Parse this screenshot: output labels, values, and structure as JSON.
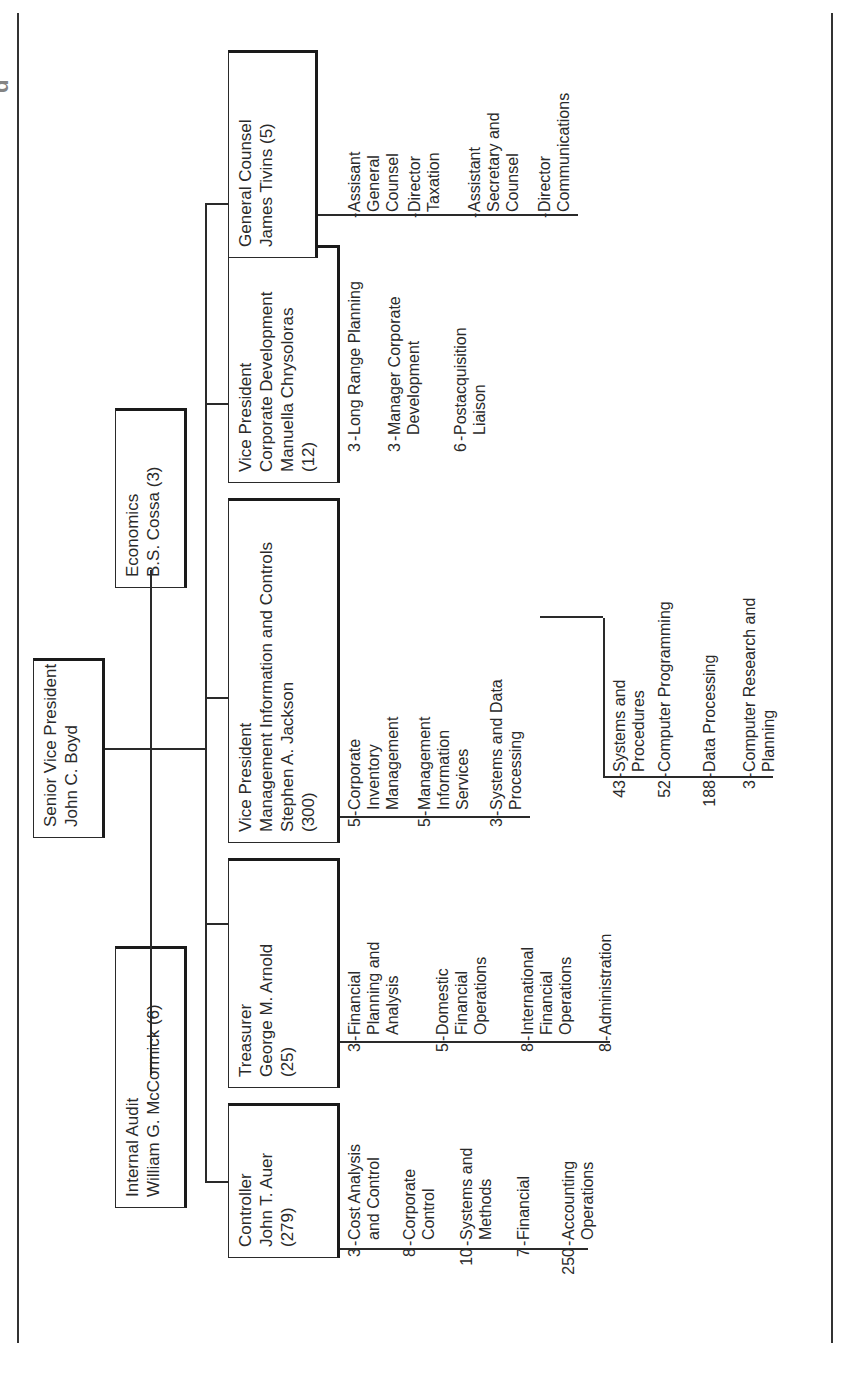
{
  "caption": "Figure … corporate financial organization (partially cut off)",
  "top": {
    "title": "Senior Vice President",
    "name": "John C. Boyd"
  },
  "staff": [
    {
      "id": "internal-audit",
      "title": "Internal Audit",
      "name": "William G. McCormick (6)"
    },
    {
      "id": "economics",
      "title": "Economics",
      "name": "B.S. Cossa (3)"
    }
  ],
  "departments": [
    {
      "id": "controller",
      "lines": [
        "Controller",
        "John T. Auer",
        "(279)"
      ],
      "units": [
        {
          "count": "3",
          "label": [
            "Cost Analysis",
            "and Control"
          ]
        },
        {
          "count": "8",
          "label": [
            "Corporate",
            "Control"
          ]
        },
        {
          "count": "10",
          "label": [
            "Systems and",
            "Methods"
          ]
        },
        {
          "count": "7",
          "label": [
            "Financial"
          ]
        },
        {
          "count": "250",
          "label": [
            "Accounting",
            "Operations"
          ]
        }
      ]
    },
    {
      "id": "treasurer",
      "lines": [
        "Treasurer",
        "George M. Arnold",
        "(25)"
      ],
      "units": [
        {
          "count": "3",
          "label": [
            "Financial",
            "Planning and",
            "Analysis"
          ]
        },
        {
          "count": "5",
          "label": [
            "Domestic",
            "Financial",
            "Operations"
          ]
        },
        {
          "count": "8",
          "label": [
            "International",
            "Financial",
            "Operations"
          ]
        },
        {
          "count": "8",
          "label": [
            "Administration"
          ]
        }
      ]
    },
    {
      "id": "vp-mic",
      "lines": [
        "Vice President",
        "Management Information and Controls",
        "Stephen A. Jackson",
        "(300)"
      ],
      "units": [
        {
          "count": "5",
          "label": [
            "Corporate",
            "Inventory",
            "Management"
          ]
        },
        {
          "count": "5",
          "label": [
            "Management",
            "Information",
            "Services"
          ]
        },
        {
          "count": "3",
          "label": [
            "Systems and Data",
            "Processing"
          ]
        }
      ],
      "subunits": [
        {
          "count": "43",
          "label": [
            "Systems and",
            "Procedures"
          ]
        },
        {
          "count": "52",
          "label": [
            "Computer Programming"
          ]
        },
        {
          "count": "188",
          "label": [
            "Data Processing"
          ]
        },
        {
          "count": "3",
          "label": [
            "Computer Research and",
            "Planning"
          ]
        }
      ]
    },
    {
      "id": "vp-cd",
      "lines": [
        "Vice President",
        "Corporate Development",
        "Manuella Chrysoloras",
        "(12)"
      ],
      "units": [
        {
          "count": "3",
          "label": [
            "Long Range Planning"
          ]
        },
        {
          "count": "3",
          "label": [
            "Manager Corporate",
            "Development"
          ]
        },
        {
          "count": "6",
          "label": [
            "Postacquisition",
            "Liaison"
          ]
        }
      ]
    },
    {
      "id": "general-counsel",
      "lines": [
        "General Counsel",
        "James Tivins (5)"
      ],
      "units": [
        {
          "count": "",
          "label": [
            "Assisant",
            "General",
            "Counsel"
          ]
        },
        {
          "count": "",
          "label": [
            "Director",
            "Taxation"
          ]
        },
        {
          "count": "",
          "label": [
            "Assistant",
            "Secretary and",
            "Counsel"
          ]
        },
        {
          "count": "",
          "label": [
            "Director",
            "Communications"
          ]
        }
      ]
    }
  ]
}
